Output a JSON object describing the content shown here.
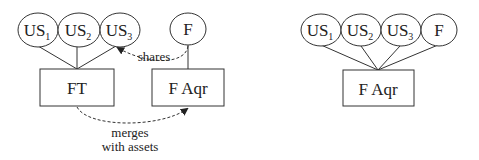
{
  "left_diagram": {
    "nodes": {
      "us1": {
        "label": "US",
        "sub": "1"
      },
      "us2": {
        "label": "US",
        "sub": "2"
      },
      "us3": {
        "label": "US",
        "sub": "3"
      },
      "f": {
        "label": "F"
      },
      "ft": {
        "label": "FT"
      },
      "faqr": {
        "label": "F Aqr"
      }
    },
    "edges": {
      "shares": {
        "label": "shares"
      },
      "merges": {
        "line1": "merges",
        "line2": "with assets"
      }
    }
  },
  "right_diagram": {
    "nodes": {
      "us1": {
        "label": "US",
        "sub": "1"
      },
      "us2": {
        "label": "US",
        "sub": "2"
      },
      "us3": {
        "label": "US",
        "sub": "3"
      },
      "f": {
        "label": "F"
      },
      "faqr": {
        "label": "F Aqr"
      }
    }
  },
  "colors": {
    "stroke": "#333333",
    "text": "#222222",
    "background": "#ffffff"
  }
}
